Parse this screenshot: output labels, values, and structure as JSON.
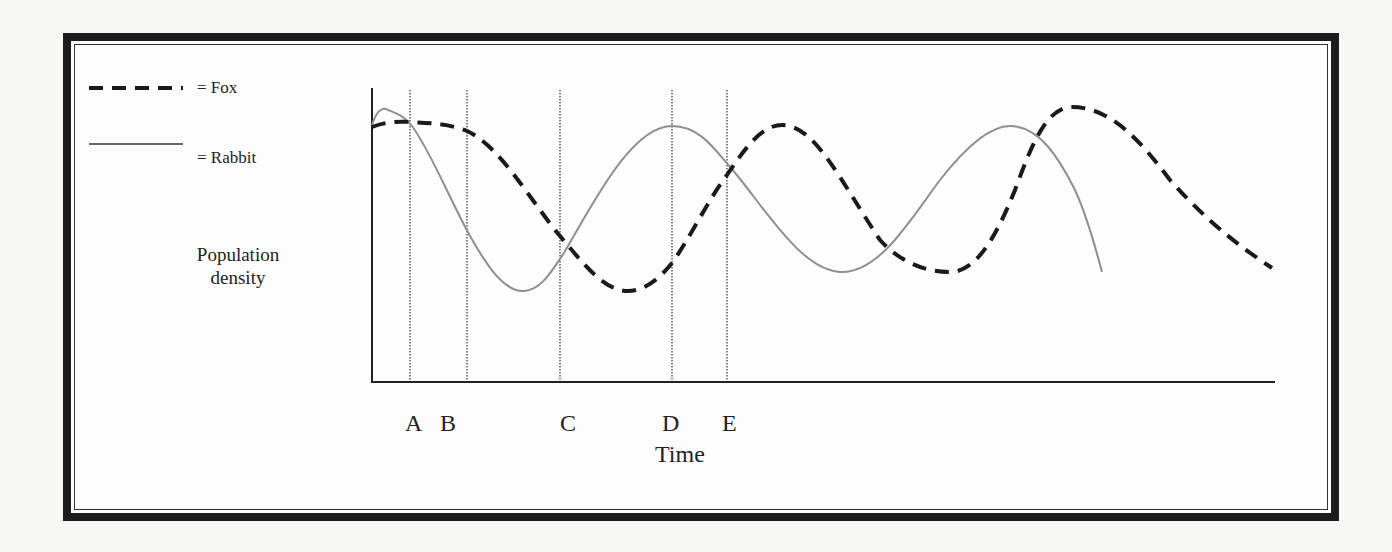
{
  "chart_data": {
    "type": "line",
    "title": "",
    "xlabel": "Time",
    "ylabel": "Population density",
    "legend": [
      {
        "name": "Fox",
        "label": "= Fox",
        "style": "dashed",
        "color": "#1a1a1a"
      },
      {
        "name": "Rabbit",
        "label": "= Rabbit",
        "style": "solid",
        "color": "#8a8a8a"
      }
    ],
    "markers": [
      "A",
      "B",
      "C",
      "D",
      "E"
    ],
    "legend_position": "top-left",
    "grid": false,
    "series": [
      {
        "name": "Rabbit",
        "description": "Oscillates; peaks near start, at D, and later; troughs between A–C and after E",
        "points_px": [
          [
            372,
            125
          ],
          [
            385,
            110
          ],
          [
            410,
            122
          ],
          [
            467,
            230
          ],
          [
            522,
            290
          ],
          [
            560,
            260
          ],
          [
            672,
            126
          ],
          [
            727,
            165
          ],
          [
            840,
            272
          ],
          [
            1010,
            126
          ],
          [
            1102,
            272
          ]
        ]
      },
      {
        "name": "Fox",
        "description": "Oscillates lagging rabbit; trough between C and D, peaks after E and near end",
        "points_px": [
          [
            372,
            127
          ],
          [
            410,
            122
          ],
          [
            467,
            130
          ],
          [
            560,
            235
          ],
          [
            628,
            291
          ],
          [
            672,
            265
          ],
          [
            727,
            175
          ],
          [
            782,
            125
          ],
          [
            950,
            272
          ],
          [
            1072,
            107
          ],
          [
            1272,
            268
          ]
        ]
      }
    ]
  },
  "legend": {
    "fox_label": "= Fox",
    "rabbit_label": "= Rabbit"
  },
  "axes": {
    "ylabel_line1": "Population",
    "ylabel_line2": "density",
    "xlabel": "Time"
  },
  "markers": [
    {
      "label": "A",
      "x": 410,
      "label_x": 405
    },
    {
      "label": "B",
      "x": 467,
      "label_x": 440
    },
    {
      "label": "C",
      "x": 560,
      "label_x": 560
    },
    {
      "label": "D",
      "x": 672,
      "label_x": 662
    },
    {
      "label": "E",
      "x": 727,
      "label_x": 722
    }
  ]
}
